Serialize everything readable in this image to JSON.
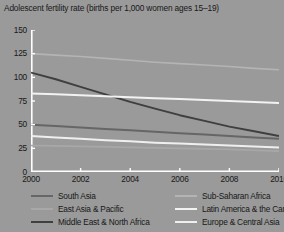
{
  "chart_data": {
    "type": "line",
    "title": "Adolescent fertility rate (births per 1,000 women ages 15–19)",
    "xlabel": "",
    "ylabel": "",
    "xlim": [
      2000,
      2010
    ],
    "ylim": [
      0,
      150
    ],
    "grid": false,
    "legend_position": "bottom",
    "background_color": "#9a9a9a",
    "axis_color": "#ffffff",
    "x": [
      2000,
      2001,
      2002,
      2003,
      2004,
      2005,
      2006,
      2007,
      2008,
      2009,
      2010
    ],
    "xticks": [
      "2000",
      "2002",
      "2004",
      "2006",
      "2008",
      "2010"
    ],
    "xtick_values": [
      2000,
      2002,
      2004,
      2006,
      2008,
      2010
    ],
    "yticks": [
      "0",
      "25",
      "50",
      "75",
      "100",
      "125",
      "150"
    ],
    "ytick_values": [
      0,
      25,
      50,
      75,
      100,
      125,
      150
    ],
    "series": [
      {
        "name": "Sub-Saharan Africa",
        "color": "#b4b4b4",
        "width": 1.6,
        "values": [
          125,
          123.5,
          122,
          120,
          118,
          116,
          114.5,
          113,
          111.5,
          109.5,
          108
        ]
      },
      {
        "name": "Middle East & North Africa",
        "color": "#3f3f3f",
        "width": 1.9,
        "values": [
          105,
          98,
          90,
          82,
          74,
          67,
          60,
          54,
          48,
          43,
          38
        ]
      },
      {
        "name": "Latin America & the Caribbean",
        "color": "#f2f2f2",
        "width": 2.0,
        "values": [
          83,
          82,
          81,
          80,
          79,
          78,
          77,
          76,
          75,
          74,
          73
        ]
      },
      {
        "name": "South Asia",
        "color": "#666666",
        "width": 2.0,
        "values": [
          50,
          48.5,
          47,
          45.5,
          44,
          42.5,
          41,
          39.5,
          38,
          36.5,
          35
        ]
      },
      {
        "name": "Europe & Central Asia",
        "color": "#efefef",
        "width": 2.0,
        "values": [
          38,
          36.5,
          35,
          33.5,
          32.5,
          31,
          30,
          29,
          28,
          27,
          26
        ]
      },
      {
        "name": "East Asia & Pacific",
        "color": "#a8a8a8",
        "width": 1.7,
        "values": [
          28,
          27.5,
          27,
          26.5,
          26,
          25.5,
          25,
          24.5,
          24,
          23,
          22
        ]
      }
    ],
    "legend": [
      {
        "label": "South Asia",
        "color": "#666666"
      },
      {
        "label": "Sub-Saharan Africa",
        "color": "#b4b4b4"
      },
      {
        "label": "East Asia & Pacific",
        "color": "#a8a8a8"
      },
      {
        "label": "Latin America & the Caribbean",
        "color": "#f2f2f2"
      },
      {
        "label": "Middle East & North Africa",
        "color": "#3f3f3f"
      },
      {
        "label": "Europe & Central Asia",
        "color": "#efefef"
      }
    ]
  }
}
